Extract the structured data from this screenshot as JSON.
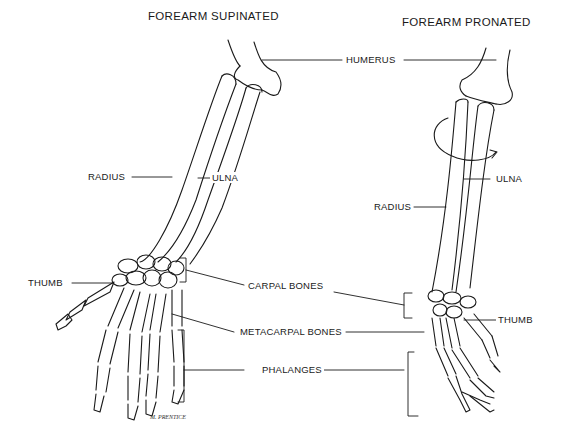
{
  "titles": {
    "left": "FOREARM SUPINATED",
    "right": "FOREARM PRONATED"
  },
  "labels": {
    "humerus": "HUMERUS",
    "radius_left": "RADIUS",
    "ulna_left": "ULNA",
    "radius_right": "RADIUS",
    "ulna_right": "ULNA",
    "thumb_left": "THUMB",
    "thumb_right": "THUMB",
    "carpal_bones": "CARPAL BONES",
    "metacarpal_bones": "METACARPAL BONES",
    "phalanges": "PHALANGES"
  },
  "signature": "M. PRENTICE",
  "colors": {
    "line": "#1a1a1a",
    "background": "#ffffff"
  }
}
